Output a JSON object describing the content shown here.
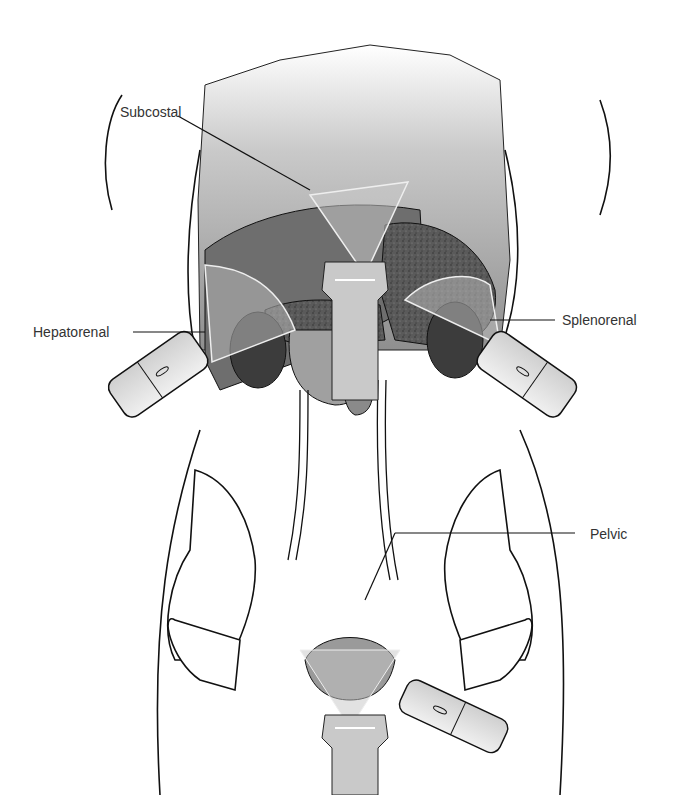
{
  "figure": {
    "labels": [
      {
        "id": "subcostal",
        "text": "Subcostal"
      },
      {
        "id": "hepatorenal",
        "text": "Hepatorenal"
      },
      {
        "id": "splenorenal",
        "text": "Splenorenal"
      },
      {
        "id": "pelvic",
        "text": "Pelvic"
      }
    ]
  },
  "colors": {
    "background": "#ffffff",
    "outline": "#111111",
    "organ_light": "#bdbdbd",
    "organ_mid": "#8a8a8a",
    "organ_dark": "#4a4a4a",
    "probe_fill": "#d8d8d8",
    "label_text": "#333333"
  }
}
